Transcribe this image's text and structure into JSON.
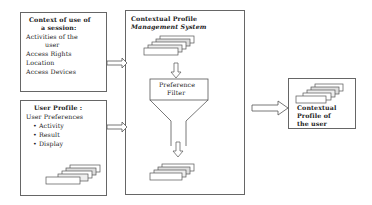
{
  "context_box": {
    "title_line1": "Context of use of",
    "title_line2": "a session:",
    "items": [
      "Activities of the",
      "user",
      "Access Rights",
      "Location",
      "Access Devices"
    ]
  },
  "profile_box": {
    "title": "User Profile :",
    "subtitle": "User Preferences",
    "bullets": [
      "• Activity",
      "• Result",
      "• Display"
    ]
  },
  "system_box": {
    "title_line1": "Contextual Profile",
    "title_line2": "Management System",
    "filter_line1": "Preference",
    "filter_line2": "Filter"
  },
  "output_box": {
    "line1": "Contextual",
    "line2": "Profile of",
    "line3": "the user"
  }
}
